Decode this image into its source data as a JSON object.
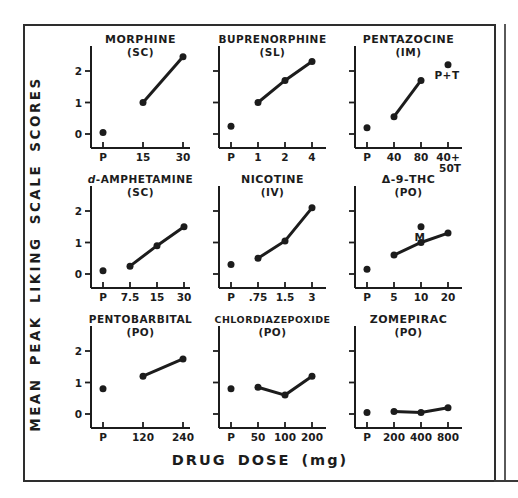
{
  "figure": {
    "y_axis_label": "MEAN PEAK LIKING SCALE SCORES",
    "x_axis_label": "DRUG DOSE (mg)",
    "ink_color": "#1c1c1c",
    "background": "#ffffff",
    "layout": "3x3 grid of dose-response subplots inside a rectangular border"
  },
  "chart_data": [
    {
      "type": "line",
      "title": "MORPHINE",
      "route": "(SC)",
      "italic_first_letter": false,
      "x_tick_labels": [
        "P",
        "15",
        "30"
      ],
      "x_tick_sublabel": null,
      "y_tick_labels": [
        "0",
        "1",
        "2"
      ],
      "y_tick_values": [
        0,
        1,
        2
      ],
      "ylim": [
        0,
        2.6
      ],
      "placebo_point": {
        "x": "P",
        "value": 0.05
      },
      "series": [
        {
          "x": "15",
          "value": 1.0
        },
        {
          "x": "30",
          "value": 2.45
        }
      ],
      "annotation_point": null
    },
    {
      "type": "line",
      "title": "BUPRENORPHINE",
      "route": "(SL)",
      "italic_first_letter": false,
      "x_tick_labels": [
        "P",
        "1",
        "2",
        "4"
      ],
      "x_tick_sublabel": null,
      "y_tick_labels": [],
      "y_tick_values": [
        0,
        1,
        2
      ],
      "ylim": [
        0,
        2.6
      ],
      "placebo_point": {
        "x": "P",
        "value": 0.25
      },
      "series": [
        {
          "x": "1",
          "value": 1.0
        },
        {
          "x": "2",
          "value": 1.7
        },
        {
          "x": "4",
          "value": 2.3
        }
      ],
      "annotation_point": null
    },
    {
      "type": "line",
      "title": "PENTAZOCINE",
      "route": "(IM)",
      "italic_first_letter": false,
      "x_tick_labels": [
        "P",
        "40",
        "80",
        "40+"
      ],
      "x_tick_sublabel": "50T",
      "y_tick_labels": [],
      "y_tick_values": [
        0,
        1,
        2
      ],
      "ylim": [
        0,
        2.6
      ],
      "placebo_point": {
        "x": "P",
        "value": 0.2
      },
      "series": [
        {
          "x": "40",
          "value": 0.55
        },
        {
          "x": "80",
          "value": 1.7
        }
      ],
      "annotation_point": {
        "x": "40+",
        "value": 2.2,
        "label": "P+T"
      }
    },
    {
      "type": "line",
      "title": "d-AMPHETAMINE",
      "route": "(SC)",
      "italic_first_letter": true,
      "x_tick_labels": [
        "P",
        "7.5",
        "15",
        "30"
      ],
      "x_tick_sublabel": null,
      "y_tick_labels": [
        "0",
        "1",
        "2"
      ],
      "y_tick_values": [
        0,
        1,
        2
      ],
      "ylim": [
        0,
        2.6
      ],
      "placebo_point": {
        "x": "P",
        "value": 0.1
      },
      "series": [
        {
          "x": "7.5",
          "value": 0.25
        },
        {
          "x": "15",
          "value": 0.9
        },
        {
          "x": "30",
          "value": 1.5
        }
      ],
      "annotation_point": null
    },
    {
      "type": "line",
      "title": "NICOTINE",
      "route": "(IV)",
      "italic_first_letter": false,
      "x_tick_labels": [
        "P",
        ".75",
        "1.5",
        "3"
      ],
      "x_tick_sublabel": null,
      "y_tick_labels": [],
      "y_tick_values": [
        0,
        1,
        2
      ],
      "ylim": [
        0,
        2.6
      ],
      "placebo_point": {
        "x": "P",
        "value": 0.3
      },
      "series": [
        {
          "x": ".75",
          "value": 0.5
        },
        {
          "x": "1.5",
          "value": 1.05
        },
        {
          "x": "3",
          "value": 2.1
        }
      ],
      "annotation_point": null
    },
    {
      "type": "line",
      "title": "Δ-9-THC",
      "route": "(PO)",
      "italic_first_letter": false,
      "x_tick_labels": [
        "P",
        "5",
        "10",
        "20"
      ],
      "x_tick_sublabel": null,
      "y_tick_labels": [],
      "y_tick_values": [
        0,
        1,
        2
      ],
      "ylim": [
        0,
        2.6
      ],
      "placebo_point": {
        "x": "P",
        "value": 0.15
      },
      "series": [
        {
          "x": "5",
          "value": 0.6
        },
        {
          "x": "10",
          "value": 1.0
        },
        {
          "x": "20",
          "value": 1.3
        }
      ],
      "annotation_point": {
        "x": "10",
        "value": 1.5,
        "label": "M"
      }
    },
    {
      "type": "line",
      "title": "PENTOBARBITAL",
      "route": "(PO)",
      "italic_first_letter": false,
      "x_tick_labels": [
        "P",
        "120",
        "240"
      ],
      "x_tick_sublabel": null,
      "y_tick_labels": [
        "0",
        "1",
        "2"
      ],
      "y_tick_values": [
        0,
        1,
        2
      ],
      "ylim": [
        0,
        2.6
      ],
      "placebo_point": {
        "x": "P",
        "value": 0.8
      },
      "series": [
        {
          "x": "120",
          "value": 1.2
        },
        {
          "x": "240",
          "value": 1.75
        }
      ],
      "annotation_point": null
    },
    {
      "type": "line",
      "title": "CHLORDIAZEPOXIDE",
      "route": "(PO)",
      "italic_first_letter": false,
      "x_tick_labels": [
        "P",
        "50",
        "100",
        "200"
      ],
      "x_tick_sublabel": null,
      "y_tick_labels": [],
      "y_tick_values": [
        0,
        1,
        2
      ],
      "ylim": [
        0,
        2.6
      ],
      "placebo_point": {
        "x": "P",
        "value": 0.8
      },
      "series": [
        {
          "x": "50",
          "value": 0.85
        },
        {
          "x": "100",
          "value": 0.6
        },
        {
          "x": "200",
          "value": 1.2
        }
      ],
      "annotation_point": null
    },
    {
      "type": "line",
      "title": "ZOMEPIRAC",
      "route": "(PO)",
      "italic_first_letter": false,
      "x_tick_labels": [
        "P",
        "200",
        "400",
        "800"
      ],
      "x_tick_sublabel": null,
      "y_tick_labels": [],
      "y_tick_values": [
        0,
        1,
        2
      ],
      "ylim": [
        0,
        2.6
      ],
      "placebo_point": {
        "x": "P",
        "value": 0.05
      },
      "series": [
        {
          "x": "200",
          "value": 0.08
        },
        {
          "x": "400",
          "value": 0.05
        },
        {
          "x": "800",
          "value": 0.2
        }
      ],
      "annotation_point": null
    }
  ]
}
